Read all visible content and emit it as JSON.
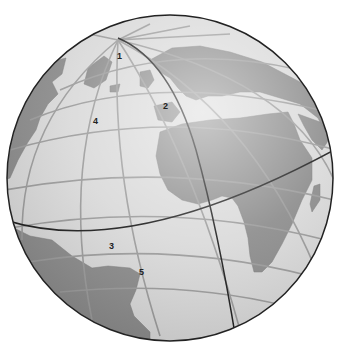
{
  "figure": {
    "type": "globe-diagram",
    "colors": {
      "background": "#ffffff",
      "ocean": "#d9d9d9",
      "land": "#8a8a8a",
      "graticule": "#9a9a9a",
      "great_circle": "#1a1a1a",
      "outline": "#222222"
    },
    "labels": [
      {
        "id": "1",
        "text": "1",
        "x": 117,
        "y": 52
      },
      {
        "id": "2",
        "text": "2",
        "x": 163,
        "y": 102
      },
      {
        "id": "3",
        "text": "3",
        "x": 109,
        "y": 242
      },
      {
        "id": "4",
        "text": "4",
        "x": 93,
        "y": 117
      },
      {
        "id": "5",
        "text": "5",
        "x": 139,
        "y": 268
      }
    ]
  }
}
